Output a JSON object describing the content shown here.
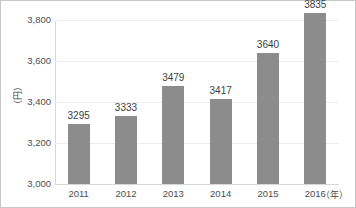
{
  "chart_data": {
    "type": "bar",
    "title": "",
    "subtitle": "",
    "xlabel": "（年）",
    "ylabel": "（円）",
    "categories": [
      "2011",
      "2012",
      "2013",
      "2014",
      "2015",
      "2016"
    ],
    "values": [
      3295,
      3333,
      3479,
      3417,
      3640,
      3835
    ],
    "data_labels": [
      "3295",
      "3333",
      "3479",
      "3417",
      "3640",
      "3835"
    ],
    "ylim": [
      3000,
      3800
    ],
    "ytick_labels": [
      "3,800",
      "3,600",
      "3,400",
      "3,200",
      "3,000"
    ],
    "ytick_values": [
      3800,
      3600,
      3400,
      3200,
      3000
    ],
    "grid": true,
    "grid_axis": "y",
    "legend": false,
    "legend_position": "none",
    "series": [
      {
        "name": "",
        "values": [
          3295,
          3333,
          3479,
          3417,
          3640,
          3835
        ],
        "color": "#8c8c8c"
      }
    ],
    "colors": {
      "bar": "#8c8c8c",
      "gridline": "#ededed",
      "axis": "#d8d8d8",
      "text": "#4d4d4d",
      "background": "#ffffff",
      "border": "#c8c8c8"
    }
  }
}
